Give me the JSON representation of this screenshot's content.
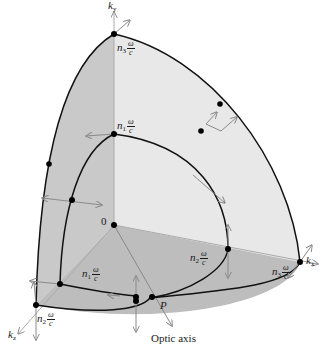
{
  "figure": {
    "type": "wave-vector surface of a biaxial crystal (one octant)",
    "colors": {
      "face_left": "#c9c9c9",
      "face_right": "#e8e8e8",
      "face_bottom": "#bdbdbd",
      "curve": "#111111",
      "arrow": "#8a8a8a",
      "axis": "#9a9a9a",
      "point": "#000000"
    }
  },
  "axes": {
    "ky": {
      "symbol": "k",
      "sub": "y"
    },
    "kx": {
      "symbol": "k",
      "sub": "x"
    },
    "kz": {
      "symbol": "k",
      "sub": "z"
    },
    "origin": "0"
  },
  "labels": {
    "n3_top": {
      "n": "n",
      "sub": "3",
      "num": "ω",
      "den": "c"
    },
    "n1_mid": {
      "n": "n",
      "sub": "1",
      "num": "ω",
      "den": "c"
    },
    "n1_low": {
      "n": "n",
      "sub": "1",
      "num": "ω",
      "den": "c"
    },
    "n2_right": {
      "n": "n",
      "sub": "2",
      "num": "ω",
      "den": "c"
    },
    "n3_right": {
      "n": "n",
      "sub": "3",
      "num": "ω",
      "den": "c"
    },
    "n2_left": {
      "n": "n",
      "sub": "2",
      "num": "ω",
      "den": "c"
    },
    "point_P": "P",
    "optic_axis": "Optic axis"
  }
}
